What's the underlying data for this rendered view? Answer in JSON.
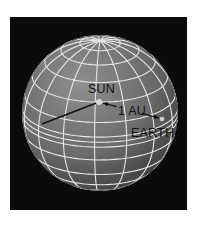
{
  "figure": {
    "background": "#0b0b0b",
    "page_background": "#ffffff"
  },
  "sphere": {
    "cx": 90,
    "cy": 96,
    "r": 78,
    "fill_light": "#8f8f8f",
    "fill_mid": "#6b6b6b",
    "fill_dark": "#3c3c3c",
    "grid_color": "#e6e6e6",
    "grid_width": 1.1,
    "tilt_deg": 22,
    "rotation_deg": 8,
    "meridian_step_deg": 24,
    "latitudes_deg": [
      -75,
      -60,
      -45,
      -30,
      -15,
      0,
      15,
      30,
      45,
      60,
      75
    ],
    "ecliptic_band_deg": [
      -4,
      4
    ]
  },
  "labels": {
    "sun": "SUN",
    "distance": "1 AU",
    "earth": "EARTH"
  },
  "points": {
    "sun": {
      "x": 89,
      "y": 85,
      "color": "#d9d9d9"
    },
    "earth": {
      "x": 152,
      "y": 102,
      "color": "#cfcfcf"
    },
    "radius_end": {
      "x": 32,
      "y": 107
    }
  },
  "lines": {
    "color": "#111111"
  }
}
